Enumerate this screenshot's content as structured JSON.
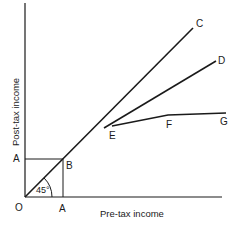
{
  "diagram": {
    "x_axis_label": "Pre-tax income",
    "y_axis_label": "Post-tax income",
    "angle_label": "45°",
    "points": {
      "origin": "O",
      "a_x": "A",
      "a_y": "A",
      "b": "B",
      "c": "C",
      "d": "D",
      "e": "E",
      "f": "F",
      "g": "G"
    },
    "lines": [
      {
        "name": "OC",
        "description": "45° line from origin through B to C"
      },
      {
        "name": "ED",
        "description": "line branching at E towards D"
      },
      {
        "name": "EFG",
        "description": "flattening line from E through F to G"
      },
      {
        "name": "A-B horizontal",
        "description": "dashed guide from y-axis A to B"
      },
      {
        "name": "A-B vertical",
        "description": "guide from x-axis A to B"
      }
    ],
    "colors": {
      "line": "#1a1a1a",
      "background": "#ffffff"
    }
  }
}
